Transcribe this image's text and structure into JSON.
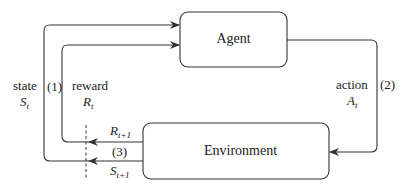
{
  "diagram": {
    "nodes": {
      "agent": {
        "label": "Agent"
      },
      "environment": {
        "label": "Environment"
      }
    },
    "edges": {
      "state": {
        "word": "state",
        "symbol": "S",
        "sub": "t",
        "step": "(1)"
      },
      "reward": {
        "word": "reward",
        "symbol": "R",
        "sub": "t"
      },
      "action": {
        "word": "action",
        "symbol": "A",
        "sub": "t",
        "step": "(2)"
      },
      "next_reward": {
        "symbol": "R",
        "sub": "t+1"
      },
      "next_state": {
        "symbol": "S",
        "sub": "t+1"
      },
      "step3": "(3)"
    },
    "colors": {
      "stroke": "#333333",
      "text": "#222222",
      "background": "#ffffff"
    }
  }
}
